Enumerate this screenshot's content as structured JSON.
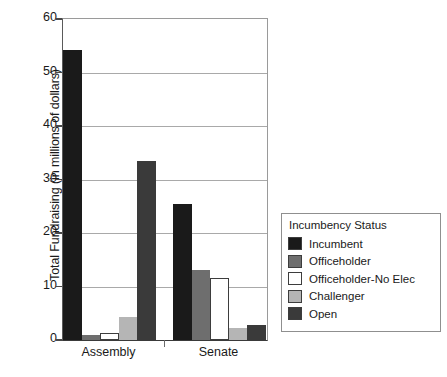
{
  "chart_data": {
    "type": "bar",
    "title": "",
    "subtitle": "",
    "xlabel": "",
    "ylabel": "Total Fundraising (in millions of dollars)",
    "categories": [
      "Assembly",
      "Senate"
    ],
    "ylim": [
      0,
      60
    ],
    "yticks": [
      0,
      10,
      20,
      30,
      40,
      50,
      60
    ],
    "ytick_labels": [
      "0",
      "10",
      "20",
      "30",
      "40",
      "50",
      "60"
    ],
    "grid": true,
    "legend_position": "right-outside",
    "legend_title": "Incumbency Status",
    "series": [
      {
        "name": "Incumbent",
        "color": "#1a1a1a",
        "values": [
          54.2,
          25.4
        ]
      },
      {
        "name": "Officeholder",
        "color": "#6e6e6e",
        "values": [
          1.0,
          13.0
        ]
      },
      {
        "name": "Officeholder-No Elec",
        "color": "#ffffff",
        "values": [
          1.4,
          11.5
        ]
      },
      {
        "name": "Challenger",
        "color": "#b5b5b5",
        "values": [
          4.3,
          2.2
        ]
      },
      {
        "name": "Open",
        "color": "#3a3a3a",
        "values": [
          33.5,
          2.8
        ]
      }
    ]
  },
  "axes": {
    "y_title": "Total Fundraising (in millions of dollars)",
    "x_tick_labels": [
      "Assembly",
      "Senate"
    ]
  },
  "legend": {
    "title": "Incumbency Status",
    "items": [
      {
        "label": "Incumbent",
        "color": "#1a1a1a"
      },
      {
        "label": "Officeholder",
        "color": "#6e6e6e"
      },
      {
        "label": "Officeholder-No Elec",
        "color": "#ffffff"
      },
      {
        "label": "Challenger",
        "color": "#b5b5b5"
      },
      {
        "label": "Open",
        "color": "#3a3a3a"
      }
    ]
  }
}
